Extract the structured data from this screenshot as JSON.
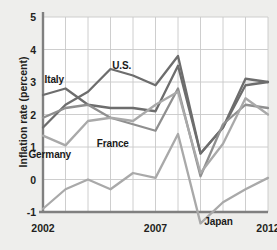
{
  "chart_data": {
    "type": "line",
    "title": "",
    "xlabel": "",
    "ylabel": "Inflation rate (percent)",
    "xlim": [
      2002,
      2012
    ],
    "ylim": [
      -1,
      5
    ],
    "grid": true,
    "legend_position": "inline-annotations",
    "x": [
      2002,
      2003,
      2004,
      2005,
      2006,
      2007,
      2008,
      2009,
      2010,
      2011,
      2012
    ],
    "xticks": [
      "2002",
      "2007",
      "2012"
    ],
    "xtick_values": [
      2002,
      2007,
      2012
    ],
    "yticks": [
      "5",
      "4",
      "3",
      "2",
      "1",
      "0",
      "-1"
    ],
    "ytick_values": [
      5,
      4,
      3,
      2,
      1,
      0,
      -1
    ],
    "series": [
      {
        "name": "U.S.",
        "color": "#6d6d6d",
        "values": [
          1.6,
          2.3,
          2.7,
          3.4,
          3.2,
          2.9,
          3.8,
          0.8,
          1.6,
          3.1,
          3.0
        ]
      },
      {
        "name": "Italy",
        "color": "#6d6d6d",
        "values": [
          2.6,
          2.8,
          2.3,
          2.2,
          2.2,
          2.1,
          3.5,
          0.8,
          1.6,
          2.9,
          3.0
        ]
      },
      {
        "name": "France",
        "color": "#8f8f8f",
        "values": [
          1.9,
          2.2,
          2.3,
          1.9,
          1.7,
          1.5,
          2.8,
          0.1,
          1.7,
          2.3,
          2.2
        ]
      },
      {
        "name": "Germany",
        "color": "#a9a9a9",
        "values": [
          1.35,
          1.05,
          1.8,
          1.9,
          1.8,
          2.3,
          2.7,
          0.2,
          1.1,
          2.5,
          2.0
        ]
      },
      {
        "name": "Japan",
        "color": "#a9a9a9",
        "values": [
          -0.9,
          -0.3,
          0.0,
          -0.3,
          0.2,
          0.05,
          1.4,
          -1.35,
          -0.7,
          -0.3,
          0.05
        ]
      }
    ],
    "annotations": [
      {
        "text": "Italy",
        "x": 2002.5,
        "y": 3.05
      },
      {
        "text": "U.S.",
        "x": 2005.5,
        "y": 3.5
      },
      {
        "text": "France",
        "x": 2005.1,
        "y": 1.1
      },
      {
        "text": "Germany",
        "x": 2002.3,
        "y": 0.75
      },
      {
        "text": "Japan",
        "x": 2009.8,
        "y": -1.3
      }
    ]
  },
  "axis": {
    "ylabel": "Inflation rate (percent)",
    "yticks": [
      "5",
      "4",
      "3",
      "2",
      "1",
      "0",
      "-1"
    ],
    "xticks": [
      "2002",
      "2007",
      "2012"
    ]
  },
  "labels": {
    "italy": "Italy",
    "us": "U.S.",
    "france": "France",
    "germany": "Germany",
    "japan": "Japan"
  },
  "colors": {
    "background": "#eeeeec",
    "plot_background": "#ffffff",
    "grid": "#c8c8c8",
    "axis": "#808080",
    "text": "#231f20",
    "us_line": "#6d6d6d",
    "italy_line": "#6d6d6d",
    "france_line": "#8f8f8f",
    "germany_line": "#a9a9a9",
    "japan_line": "#a9a9a9"
  }
}
